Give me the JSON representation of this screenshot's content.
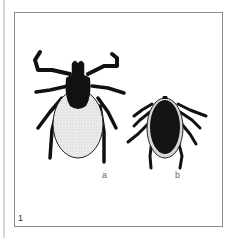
{
  "figure": {
    "number": "1",
    "labels": {
      "a": "a",
      "b": "b"
    }
  },
  "specimens": [
    {
      "id": "a",
      "subject": "tick-large",
      "scutum_color": "#111111",
      "body_color": "#ececec"
    },
    {
      "id": "b",
      "subject": "tick-small",
      "scutum_color": "#111111",
      "body_color": "#141414"
    }
  ],
  "colors": {
    "frame_border": "#8c8c8c",
    "background": "#ffffff",
    "ink": "#111111"
  }
}
